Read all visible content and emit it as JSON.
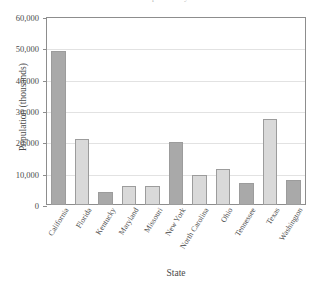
{
  "chart_data": {
    "type": "bar",
    "title": "Population by State",
    "xlabel": "State",
    "ylabel": "Population (thousands)",
    "ylim": [
      0,
      60000
    ],
    "ytick_labels": [
      "60,000",
      "50,000",
      "40,000",
      "30,000",
      "20,000",
      "10,000",
      "0"
    ],
    "ytick_values": [
      60000,
      50000,
      40000,
      30000,
      20000,
      10000,
      0
    ],
    "grid": true,
    "legend": "none",
    "categories": [
      "California",
      "Florida",
      "Kentucky",
      "Maryland",
      "Missouri",
      "New York",
      "North Carolina",
      "Ohio",
      "Tennessee",
      "Texas",
      "Washington"
    ],
    "values": [
      49000,
      21000,
      4200,
      6000,
      6000,
      20000,
      9500,
      11500,
      7000,
      27500,
      8000
    ],
    "bar_shades": [
      "dark",
      "light",
      "dark",
      "light",
      "light",
      "dark",
      "light",
      "light",
      "dark",
      "light",
      "dark"
    ]
  },
  "colors": {
    "bar_dark": "#a9a9a9",
    "bar_light": "#d9d9d9",
    "bar_border": "#9c9c9c",
    "axis": "#8d8d8d",
    "grid": "#e2e2e2",
    "text": "#4a4a4a",
    "background": "#ffffff"
  }
}
